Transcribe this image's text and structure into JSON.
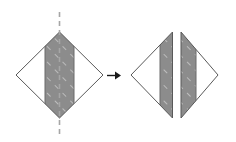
{
  "figure": {
    "canvas": {
      "width": 236,
      "height": 142,
      "background": "#ffffff"
    },
    "colors": {
      "outline": "#595959",
      "band_fill": "#8c8c8c",
      "band_outline": "#6b6b6b",
      "hatch": "#c9c9c9",
      "fold_line": "#a6a6a6",
      "arrow": "#1a1a1a",
      "white": "#ffffff"
    },
    "left_shape": {
      "label": "diamond-before",
      "type": "diamond",
      "left_vertex": [
        16,
        75
      ],
      "top_vertex": [
        59.5,
        32
      ],
      "right_vertex": [
        103,
        75
      ],
      "bottom_vertex": [
        59.5,
        118
      ],
      "band_left_x": 45,
      "band_right_x": 74,
      "fold_line": {
        "label": "vertical-fold-line",
        "x": 59.5,
        "y_start": 12,
        "y_end": 135,
        "style": "dashed"
      }
    },
    "arrow": {
      "label": "transform-arrow",
      "direction": "right",
      "x_start": 107,
      "x_end": 121,
      "y": 75.5
    },
    "right_shape": {
      "label": "diamond-after-split",
      "type": "split-diamond",
      "left_half": {
        "left_vertex": [
          131,
          75
        ],
        "top_vertex": [
          172.5,
          32
        ],
        "bottom_vertex": [
          172.5,
          118
        ],
        "band_left_x": 160,
        "band_right_x": 172.5
      },
      "right_half": {
        "right_vertex": [
          218,
          75
        ],
        "top_vertex": [
          181,
          32
        ],
        "bottom_vertex": [
          181,
          118
        ],
        "band_left_x": 181,
        "band_right_x": 196
      },
      "gap_width": 8.5
    },
    "hatch": {
      "label": "diagonal-hatch-pattern",
      "angle_deg": -45,
      "spacing": 11,
      "dash": "5 6"
    }
  }
}
